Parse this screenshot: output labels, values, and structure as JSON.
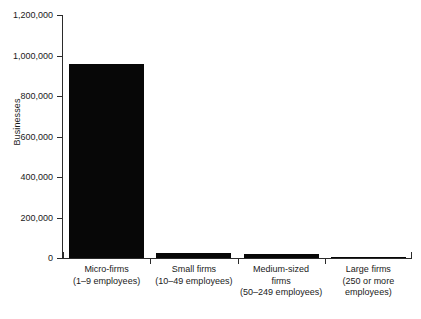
{
  "chart_data": {
    "type": "bar",
    "title": "",
    "xlabel": "",
    "ylabel": "Businesses",
    "categories": [
      "Micro-firms (1–9 employees)",
      "Small firms (10–49 employees)",
      "Medium-sized firms (50–249 employees)",
      "Large firms (250 or more employees)"
    ],
    "values": [
      960000,
      25000,
      22000,
      6000
    ],
    "ylim": [
      0,
      1200000
    ],
    "yticks": [
      0,
      200000,
      400000,
      600000,
      800000,
      1000000,
      1200000
    ],
    "ytick_labels": [
      "0",
      "200,000",
      "400,000",
      "600,000",
      "800,000",
      "1,000,000",
      "1,200,000"
    ],
    "grid": false,
    "legend": null,
    "bar_color": "#070707",
    "axis_color": "#2b2b2b"
  },
  "axis": {
    "y_title": "Businesses",
    "ticks": [
      {
        "label": "1,200,000",
        "value": 1200000
      },
      {
        "label": "1,000,000",
        "value": 1000000
      },
      {
        "label": "800,000",
        "value": 800000
      },
      {
        "label": "600,000",
        "value": 600000
      },
      {
        "label": "400,000",
        "value": 400000
      },
      {
        "label": "200,000",
        "value": 200000
      },
      {
        "label": "0",
        "value": 0
      }
    ]
  },
  "categories": [
    {
      "name": "micro-firms",
      "line1": "Micro-firms",
      "line2": "(1–9 employees)",
      "line3": "",
      "value": 960000
    },
    {
      "name": "small-firms",
      "line1": "Small firms",
      "line2": "(10–49 employees)",
      "line3": "",
      "value": 25000
    },
    {
      "name": "medium-sized-firms",
      "line1": "Medium-sized",
      "line2": "firms",
      "line3": "(50–249 employees)",
      "value": 22000
    },
    {
      "name": "large-firms",
      "line1": "Large firms",
      "line2": "(250 or more",
      "line3": "employees)",
      "value": 6000
    }
  ]
}
